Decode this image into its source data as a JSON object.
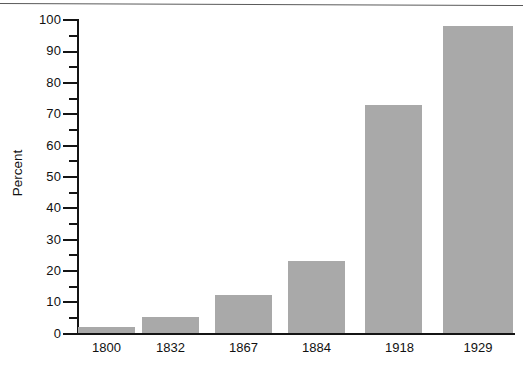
{
  "chart_data": {
    "type": "bar",
    "title": "",
    "subtitle": "",
    "xlabel": "",
    "ylabel": "Percent",
    "categories": [
      "1800",
      "1832",
      "1867",
      "1884",
      "1918",
      "1929"
    ],
    "values": [
      2,
      5,
      12,
      23,
      73,
      98
    ],
    "series": [
      {
        "name": "Percent",
        "values": [
          2,
          5,
          12,
          23,
          73,
          98
        ]
      }
    ],
    "ylim": [
      0,
      100
    ],
    "y_major_ticks": [
      0,
      10,
      20,
      30,
      40,
      50,
      60,
      70,
      80,
      90,
      100
    ],
    "y_major_tick_labels": [
      "0",
      "10",
      "20",
      "30",
      "40",
      "50",
      "60",
      "70",
      "80",
      "90",
      "100"
    ],
    "y_minor_ticks": [
      5,
      15,
      25,
      35,
      45,
      55,
      65,
      75,
      85,
      95
    ],
    "grid": false,
    "legend": false,
    "legend_position": "none",
    "bar_color": "#a9a9a9",
    "axis_color": "#141414",
    "background_color": "#ffffff"
  }
}
